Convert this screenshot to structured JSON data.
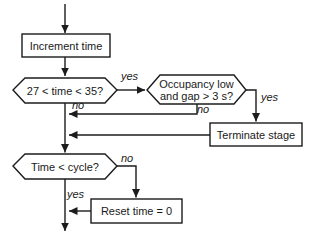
{
  "diagram": {
    "background": "#ffffff",
    "line_color": "#1c1c1c",
    "nodes": {
      "increment_time": {
        "type": "process",
        "label": "Increment time"
      },
      "time_window_decision": {
        "type": "decision",
        "label": "27 < time < 35?"
      },
      "occupancy_decision": {
        "type": "decision",
        "line1": "Occupancy low",
        "line2": "and gap > 3 s?"
      },
      "terminate_stage": {
        "type": "process",
        "label": "Terminate stage"
      },
      "cycle_decision": {
        "type": "decision",
        "label": "Time < cycle?"
      },
      "reset_time": {
        "type": "process",
        "label": "Reset time = 0"
      }
    },
    "edge_labels": {
      "time_window_yes": "yes",
      "time_window_no": "no",
      "occupancy_yes": "yes",
      "occupancy_no": "no",
      "cycle_no": "no",
      "cycle_yes": "yes"
    }
  }
}
